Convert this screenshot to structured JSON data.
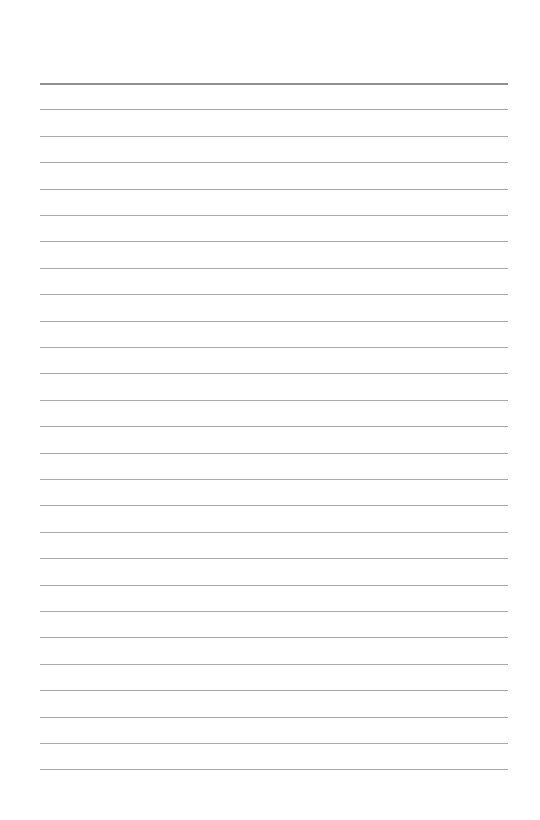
{
  "page": {
    "type": "blank lined paper",
    "background_color": "#ffffff",
    "line_color": "#a9a9a9",
    "header_line_color": "#8f8f8f",
    "line_count": 27,
    "first_line_y": 83,
    "line_spacing": 26.4,
    "line_left": 40,
    "line_width": 468
  }
}
